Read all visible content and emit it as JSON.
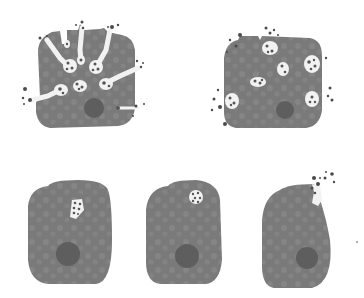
{
  "figure": {
    "colors": {
      "background": "#ffffff",
      "cytoplasm": "#7a7a7a",
      "cytoplasm_mottle": "#8c8c8c",
      "nucleus": "#5e5e5e",
      "vesicle_fill": "#f2f2f2",
      "granule": "#555555",
      "released_granule": "#4a4a4a"
    },
    "panels": [
      {
        "id": "top-left",
        "label": "extensive compound exocytosis with channels to surface"
      },
      {
        "id": "top-right",
        "label": "multiple vesicles fusing with plasma membrane"
      },
      {
        "id": "bottom-left",
        "label": "single intracellular granule-containing vesicle"
      },
      {
        "id": "bottom-middle",
        "label": "vesicle near plasma membrane"
      },
      {
        "id": "bottom-right",
        "label": "vesicle fused releasing granules"
      }
    ]
  }
}
